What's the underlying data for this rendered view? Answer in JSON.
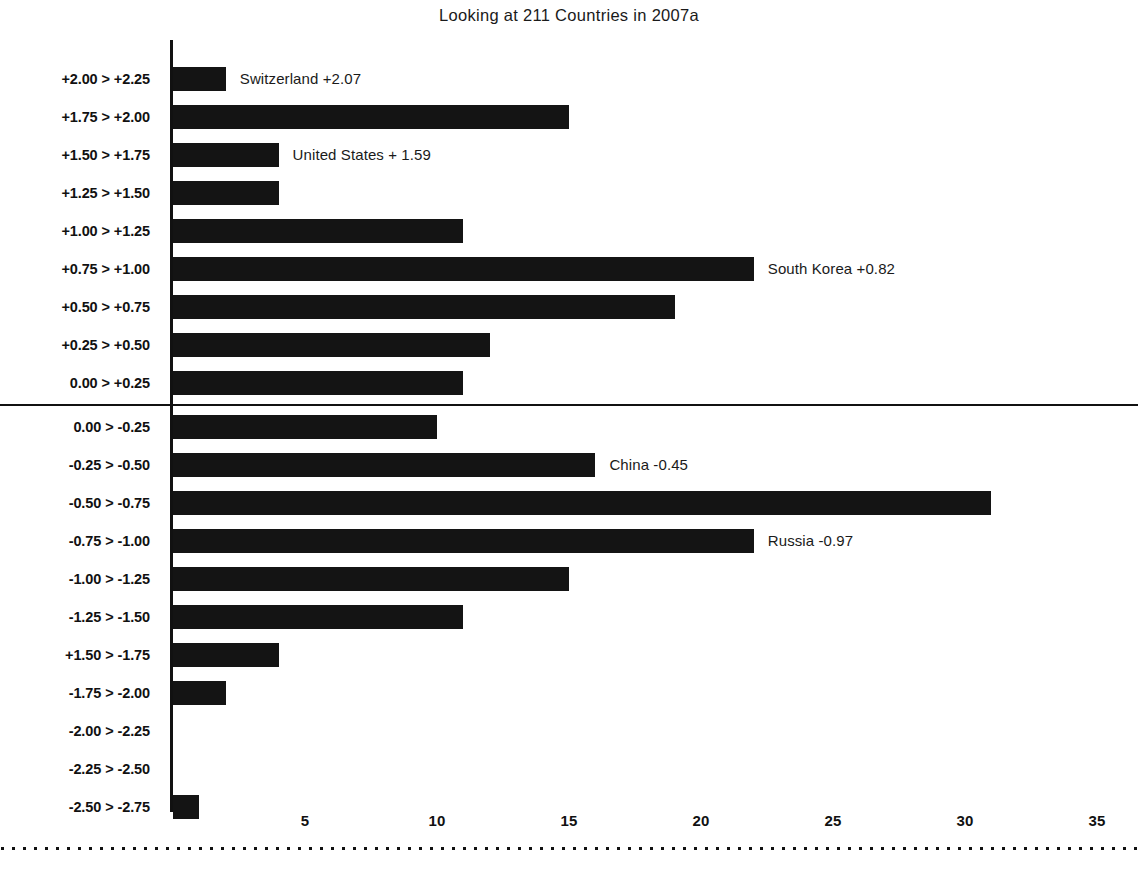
{
  "chart_data": {
    "type": "bar",
    "orientation": "horizontal",
    "title": "Looking at 211 Countries in 2007a",
    "xlabel": "",
    "ylabel": "Z-Score Ranges",
    "xlim": [
      0,
      36
    ],
    "ylim": null,
    "grid": false,
    "legend": null,
    "xticks": [
      5,
      10,
      15,
      20,
      25,
      30,
      35
    ],
    "xtick_labels": [
      "5",
      "10",
      "15",
      "20",
      "25",
      "30",
      "35"
    ],
    "categories": [
      "+2.00 > +2.25",
      "+1.75 > +2.00",
      "+1.50 > +1.75",
      "+1.25 > +1.50",
      "+1.00 > +1.25",
      "+0.75 > +1.00",
      "+0.50 > +0.75",
      "+0.25 > +0.50",
      "0.00 > +0.25",
      "0.00 > -0.25",
      "-0.25 > -0.50",
      "-0.50 > -0.75",
      "-0.75 > -1.00",
      "-1.00 > -1.25",
      "-1.25 > -1.50",
      "+1.50 > -1.75",
      "-1.75 > -2.00",
      "-2.00 > -2.25",
      "-2.25 > -2.50",
      "-2.50 > -2.75"
    ],
    "values": [
      2,
      15,
      4,
      4,
      11,
      22,
      19,
      12,
      11,
      10,
      16,
      31,
      22,
      15,
      11,
      4,
      2,
      0,
      0,
      1
    ],
    "annotations": [
      {
        "category": "+2.00 > +2.25",
        "text": "Switzerland +2.07"
      },
      {
        "category": "+1.50 > +1.75",
        "text": "United States + 1.59"
      },
      {
        "category": "+0.75 > +1.00",
        "text": "South Korea +0.82"
      },
      {
        "category": "-0.25 > -0.50",
        "text": "China -0.45"
      },
      {
        "category": "-0.75 > -1.00",
        "text": "Russia -0.97"
      }
    ],
    "bar_color": "#141414",
    "axis_color": "#111111",
    "background_color": "#ffffff"
  }
}
